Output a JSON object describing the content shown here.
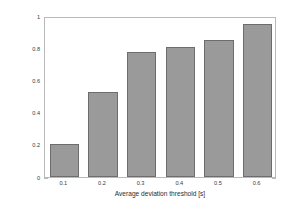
{
  "chart_data": {
    "type": "bar",
    "title": "",
    "xlabel": "Average deviation threshold [s]",
    "ylabel": "Precision",
    "categories": [
      "0.1",
      "0.2",
      "0.3",
      "0.4",
      "0.5",
      "0.6"
    ],
    "values": [
      0.21,
      0.535,
      0.785,
      0.82,
      0.86,
      0.965
    ],
    "xlim": [
      0.05,
      0.65
    ],
    "ylim": [
      0,
      1
    ],
    "yticks": [
      "1",
      "0.8",
      "0.6",
      "0.4",
      "0.2",
      "0"
    ],
    "ytick_values": [
      1,
      0.8,
      0.6,
      0.4,
      0.2,
      0
    ],
    "xticks": [
      "0.1",
      "0.2",
      "0.3",
      "0.4",
      "0.5",
      "0.6"
    ],
    "grid": false,
    "legend": null,
    "bar_color": "#9a9a9a",
    "bar_edge_color": "#6d6d6d",
    "axis_color": "#b9b9b9",
    "background": "#ffffff"
  }
}
